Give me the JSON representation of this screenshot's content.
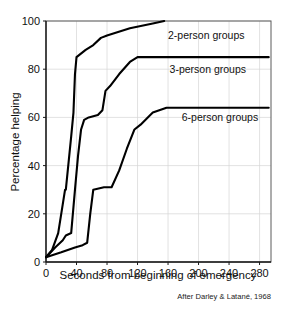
{
  "chart_data": {
    "type": "line",
    "title": "",
    "xlabel": "Seconds from beginning of emergency",
    "ylabel": "Percentage helping",
    "xlim": [
      0,
      295
    ],
    "ylim": [
      0,
      100
    ],
    "grid": true,
    "legend_position": "inline-right-of-curve",
    "xticks": [
      0,
      40,
      80,
      120,
      160,
      200,
      240,
      280
    ],
    "yticks": [
      0,
      20,
      40,
      60,
      80,
      100
    ],
    "xtick_labels": [
      "0",
      "40",
      "80",
      "120",
      "160",
      "200",
      "240",
      "280"
    ],
    "ytick_labels": [
      "0",
      "20",
      "40",
      "60",
      "80",
      "100"
    ],
    "annotations": [
      {
        "text": "After Darley & Latané, 1968",
        "position": "below-right"
      }
    ],
    "series": [
      {
        "name": "2-person groups",
        "label": "2-person groups",
        "color": "#000000",
        "label_x": 160,
        "label_y": 94,
        "points": [
          [
            0,
            2
          ],
          [
            8,
            5
          ],
          [
            16,
            12
          ],
          [
            22,
            24
          ],
          [
            25,
            30
          ],
          [
            26,
            30
          ],
          [
            33,
            52
          ],
          [
            36,
            62
          ],
          [
            38,
            78
          ],
          [
            40,
            85
          ],
          [
            52,
            88
          ],
          [
            62,
            90
          ],
          [
            72,
            93
          ],
          [
            80,
            94
          ],
          [
            110,
            97
          ],
          [
            140,
            99
          ],
          [
            155,
            100
          ]
        ]
      },
      {
        "name": "3-person groups",
        "label": "3-person groups",
        "color": "#000000",
        "label_x": 162,
        "label_y": 80,
        "points": [
          [
            0,
            2
          ],
          [
            12,
            6
          ],
          [
            22,
            9
          ],
          [
            26,
            11
          ],
          [
            33,
            12
          ],
          [
            38,
            30
          ],
          [
            42,
            44
          ],
          [
            46,
            55
          ],
          [
            50,
            59
          ],
          [
            56,
            60
          ],
          [
            68,
            61
          ],
          [
            74,
            63
          ],
          [
            78,
            71
          ],
          [
            84,
            73
          ],
          [
            96,
            78
          ],
          [
            110,
            83
          ],
          [
            120,
            85
          ],
          [
            160,
            85
          ],
          [
            240,
            85
          ],
          [
            292,
            85
          ]
        ]
      },
      {
        "name": "6-person groups",
        "label": "6-person groups",
        "color": "#000000",
        "label_x": 178,
        "label_y": 60,
        "points": [
          [
            0,
            2
          ],
          [
            20,
            4
          ],
          [
            38,
            6
          ],
          [
            48,
            7
          ],
          [
            54,
            8
          ],
          [
            58,
            20
          ],
          [
            62,
            30
          ],
          [
            76,
            31
          ],
          [
            86,
            31
          ],
          [
            96,
            38
          ],
          [
            106,
            47
          ],
          [
            116,
            55
          ],
          [
            124,
            57
          ],
          [
            140,
            62
          ],
          [
            158,
            64
          ],
          [
            200,
            64
          ],
          [
            250,
            64
          ],
          [
            292,
            64
          ]
        ]
      }
    ]
  }
}
